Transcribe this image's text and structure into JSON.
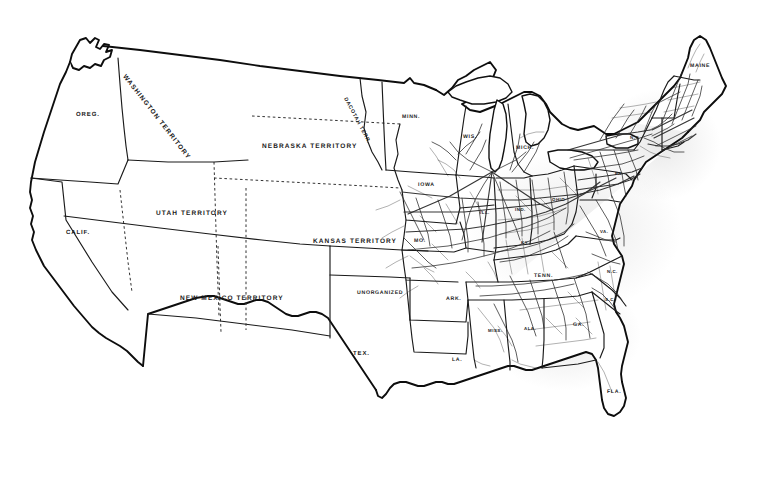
{
  "document": {
    "kind": "historical-map",
    "title": "United States Map with Railroad Network, circa 1860",
    "background_color": "#ffffff",
    "ink_color": "#111111",
    "width": 765,
    "height": 484
  },
  "labels": {
    "territories": [
      {
        "id": "washington-territory",
        "text": "WASHINGTON TERRITORY",
        "x": 124,
        "y": 72,
        "rotate": 52,
        "size": "lbl-terr"
      },
      {
        "id": "nebraska-territory",
        "text": "NEBRASKA TERRITORY",
        "x": 262,
        "y": 143,
        "rotate": 0,
        "size": "lbl-terr"
      },
      {
        "id": "dacotah-territory",
        "text": "DACOTAH TERR.",
        "x": 345,
        "y": 95,
        "rotate": 62,
        "size": "lbl-small"
      },
      {
        "id": "utah-territory",
        "text": "UTAH TERRITORY",
        "x": 156,
        "y": 210,
        "rotate": 0,
        "size": "lbl-terr"
      },
      {
        "id": "kansas-territory",
        "text": "KANSAS TERRITORY",
        "x": 313,
        "y": 238,
        "rotate": 0,
        "size": "lbl-terr"
      },
      {
        "id": "new-mexico-territory",
        "text": "NEW MEXICO TERRITORY",
        "x": 180,
        "y": 295,
        "rotate": 0,
        "size": "lbl-terr"
      },
      {
        "id": "unorganized",
        "text": "UNORGANIZED",
        "x": 357,
        "y": 290,
        "rotate": 0,
        "size": "lbl-small"
      }
    ],
    "states": [
      {
        "id": "oregon",
        "text": "OREG.",
        "x": 76,
        "y": 112,
        "rotate": 0,
        "size": "lbl-state"
      },
      {
        "id": "california",
        "text": "CALIF.",
        "x": 66,
        "y": 230,
        "rotate": 0,
        "size": "lbl-state"
      },
      {
        "id": "texas",
        "text": "TEX.",
        "x": 353,
        "y": 351,
        "rotate": 0,
        "size": "lbl-state"
      },
      {
        "id": "minnesota",
        "text": "MINN.",
        "x": 402,
        "y": 114,
        "rotate": 0,
        "size": "lbl-small"
      },
      {
        "id": "wisconsin",
        "text": "WIS.",
        "x": 463,
        "y": 134,
        "rotate": 0,
        "size": "lbl-small"
      },
      {
        "id": "michigan",
        "text": "MICH.",
        "x": 516,
        "y": 145,
        "rotate": 0,
        "size": "lbl-small"
      },
      {
        "id": "iowa",
        "text": "IOWA",
        "x": 418,
        "y": 182,
        "rotate": 0,
        "size": "lbl-small"
      },
      {
        "id": "missouri",
        "text": "MO.",
        "x": 414,
        "y": 238,
        "rotate": 0,
        "size": "lbl-small"
      },
      {
        "id": "illinois",
        "text": "ILL.",
        "x": 480,
        "y": 210,
        "rotate": 0,
        "size": "lbl-tiny"
      },
      {
        "id": "indiana",
        "text": "IND.",
        "x": 515,
        "y": 207,
        "rotate": 0,
        "size": "lbl-tiny"
      },
      {
        "id": "ohio",
        "text": "OHIO",
        "x": 552,
        "y": 197,
        "rotate": 0,
        "size": "lbl-tiny"
      },
      {
        "id": "kentucky",
        "text": "KY.",
        "x": 521,
        "y": 240,
        "rotate": 0,
        "size": "lbl-tiny"
      },
      {
        "id": "tennessee",
        "text": "TENN.",
        "x": 534,
        "y": 273,
        "rotate": 0,
        "size": "lbl-small"
      },
      {
        "id": "arkansas",
        "text": "ARK.",
        "x": 446,
        "y": 296,
        "rotate": 0,
        "size": "lbl-small"
      },
      {
        "id": "louisiana",
        "text": "LA.",
        "x": 452,
        "y": 357,
        "rotate": 0,
        "size": "lbl-small"
      },
      {
        "id": "mississippi",
        "text": "MISS.",
        "x": 488,
        "y": 328,
        "rotate": 0,
        "size": "lbl-tiny"
      },
      {
        "id": "alabama",
        "text": "ALA.",
        "x": 524,
        "y": 326,
        "rotate": 0,
        "size": "lbl-tiny"
      },
      {
        "id": "georgia",
        "text": "GA.",
        "x": 573,
        "y": 322,
        "rotate": 0,
        "size": "lbl-small"
      },
      {
        "id": "florida",
        "text": "FLA.",
        "x": 607,
        "y": 389,
        "rotate": 0,
        "size": "lbl-small"
      },
      {
        "id": "south-carolina",
        "text": "S.C.",
        "x": 605,
        "y": 297,
        "rotate": 0,
        "size": "lbl-tiny"
      },
      {
        "id": "north-carolina",
        "text": "N.C.",
        "x": 607,
        "y": 269,
        "rotate": 0,
        "size": "lbl-tiny"
      },
      {
        "id": "virginia",
        "text": "VA.",
        "x": 600,
        "y": 229,
        "rotate": 0,
        "size": "lbl-tiny"
      },
      {
        "id": "pennsylvania",
        "text": "PA.",
        "x": 615,
        "y": 171,
        "rotate": 0,
        "size": "lbl-tiny"
      },
      {
        "id": "new-york",
        "text": "N.Y.",
        "x": 630,
        "y": 135,
        "rotate": 0,
        "size": "lbl-tiny"
      },
      {
        "id": "maine",
        "text": "MAINE",
        "x": 690,
        "y": 63,
        "rotate": 0,
        "size": "lbl-small"
      }
    ]
  },
  "features": {
    "rail_network_note": "dense railroad lines concentrated east of the Mississippi River",
    "lakes": [
      "Lake Superior",
      "Lake Michigan",
      "Lake Huron",
      "Lake Erie",
      "Lake Ontario"
    ]
  }
}
